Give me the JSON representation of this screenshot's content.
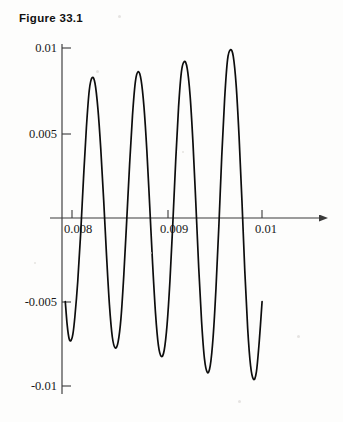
{
  "figure": {
    "title": "Figure 33.1"
  },
  "chart_data": {
    "type": "line",
    "title": "Figure 33.1",
    "xlabel": "",
    "ylabel": "",
    "xlim": [
      0.00785,
      0.01025
    ],
    "ylim": [
      -0.0105,
      0.0105
    ],
    "grid": false,
    "legend": null,
    "x_ticks": [
      0.008,
      0.009,
      0.01
    ],
    "x_tick_labels": [
      "0.008",
      "0.009",
      "0.01"
    ],
    "y_ticks": [
      0.01,
      0.005,
      -0.005,
      -0.01
    ],
    "y_tick_labels": [
      "0.01",
      "0.005",
      "-0.005",
      "-0.01"
    ],
    "axis_style": {
      "x_axis_at_y": 0,
      "y_axis_at_x": 0.00785,
      "x_axis_arrow": true,
      "tick_direction": "inward-up"
    },
    "series": [
      {
        "name": "beat-waveform",
        "description": "Rapidly oscillating wave with slowly growing envelope; four positive peaks and four negative troughs visible between x=0.00793 and x=0.00998",
        "x": [
          0.00793,
          0.00795,
          0.00797,
          0.00799,
          0.00801,
          0.00803,
          0.00806,
          0.00809,
          0.00812,
          0.00815,
          0.00818,
          0.00821,
          0.00824,
          0.00827,
          0.0083,
          0.00833,
          0.00836,
          0.00839,
          0.00842,
          0.00845,
          0.00848,
          0.00851,
          0.00854,
          0.00857,
          0.0086,
          0.00863,
          0.00866,
          0.00869,
          0.00872,
          0.00875,
          0.00878,
          0.00881,
          0.00884,
          0.00887,
          0.0089,
          0.00893,
          0.00896,
          0.00899,
          0.00902,
          0.00905,
          0.00908,
          0.00911,
          0.00914,
          0.00917,
          0.0092,
          0.00923,
          0.00926,
          0.00929,
          0.00932,
          0.00935,
          0.00938,
          0.00941,
          0.00944,
          0.00947,
          0.0095,
          0.00953,
          0.00956,
          0.00959,
          0.00962,
          0.00965,
          0.00968,
          0.00971,
          0.00974,
          0.00977,
          0.0098,
          0.00983,
          0.00986,
          0.00989,
          0.00992,
          0.00995,
          0.00998
        ],
        "y": [
          -0.005,
          -0.0064,
          -0.0072,
          -0.0073,
          -0.0069,
          -0.0059,
          -0.0038,
          -0.001,
          0.0023,
          0.0053,
          0.0075,
          0.00825,
          0.0079,
          0.0064,
          0.004,
          0.001,
          -0.0023,
          -0.0052,
          -0.0071,
          -0.00775,
          -0.0074,
          -0.006,
          -0.0034,
          -0.0002,
          0.0031,
          0.006,
          0.008,
          0.0086,
          0.0081,
          0.0065,
          0.0039,
          0.0006,
          -0.0028,
          -0.0057,
          -0.0076,
          -0.00825,
          -0.0079,
          -0.0064,
          -0.0038,
          -0.0004,
          0.0033,
          0.0065,
          0.0086,
          0.0092,
          0.0088,
          0.0072,
          0.0044,
          0.0008,
          -0.003,
          -0.0062,
          -0.0084,
          -0.0092,
          -0.0088,
          -0.0071,
          -0.0042,
          -0.0005,
          0.0036,
          0.007,
          0.0093,
          0.0099,
          0.0095,
          0.0078,
          0.0048,
          0.001,
          -0.0032,
          -0.0066,
          -0.0088,
          -0.0096,
          -0.0092,
          -0.0074,
          -0.005
        ],
        "peaks": [
          {
            "x": 0.00821,
            "y": 0.00825
          },
          {
            "x": 0.00869,
            "y": 0.0086
          },
          {
            "x": 0.00917,
            "y": 0.0092
          },
          {
            "x": 0.00965,
            "y": 0.0099
          }
        ],
        "troughs": [
          {
            "x": 0.00799,
            "y": -0.0073
          },
          {
            "x": 0.00845,
            "y": -0.00775
          },
          {
            "x": 0.00893,
            "y": -0.00825
          },
          {
            "x": 0.00941,
            "y": -0.0092
          }
        ],
        "start_point": {
          "x": 0.00793,
          "y": -0.005
        },
        "end_point": {
          "x": 0.00998,
          "y": -0.005
        },
        "color": "#0d0d0d"
      }
    ]
  }
}
